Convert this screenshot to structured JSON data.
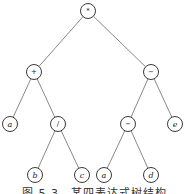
{
  "diagram": {
    "type": "expression-tree",
    "nodes": [
      {
        "id": "n0",
        "label": "*",
        "kind": "operator",
        "x": 88,
        "y": 11
      },
      {
        "id": "n1",
        "label": "+",
        "kind": "operator",
        "x": 34,
        "y": 72
      },
      {
        "id": "n2",
        "label": "−",
        "kind": "operator",
        "x": 151,
        "y": 72
      },
      {
        "id": "n3",
        "label": "a",
        "kind": "operand",
        "x": 10,
        "y": 124
      },
      {
        "id": "n4",
        "label": "/",
        "kind": "operator",
        "x": 58,
        "y": 124
      },
      {
        "id": "n5",
        "label": "−",
        "kind": "operator",
        "x": 128,
        "y": 124
      },
      {
        "id": "n6",
        "label": "e",
        "kind": "operand",
        "x": 175,
        "y": 124
      },
      {
        "id": "n7",
        "label": "b",
        "kind": "operand",
        "x": 35,
        "y": 175
      },
      {
        "id": "n8",
        "label": "c",
        "kind": "operand",
        "x": 82,
        "y": 175
      },
      {
        "id": "n9",
        "label": "a",
        "kind": "operand",
        "x": 104,
        "y": 175
      },
      {
        "id": "n10",
        "label": "d",
        "kind": "operand",
        "x": 151,
        "y": 175
      }
    ],
    "edges": [
      [
        "n0",
        "n1"
      ],
      [
        "n0",
        "n2"
      ],
      [
        "n1",
        "n3"
      ],
      [
        "n1",
        "n4"
      ],
      [
        "n2",
        "n5"
      ],
      [
        "n2",
        "n6"
      ],
      [
        "n4",
        "n7"
      ],
      [
        "n4",
        "n8"
      ],
      [
        "n5",
        "n9"
      ],
      [
        "n5",
        "n10"
      ]
    ],
    "node_radius": 7.5
  },
  "caption": "图 5.3　某四表达式树结构"
}
